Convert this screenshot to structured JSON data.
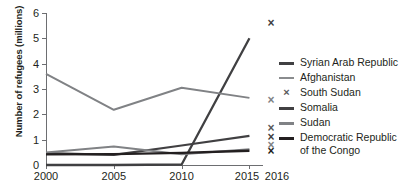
{
  "chart_data": {
    "type": "line",
    "title": "",
    "xlabel": "",
    "ylabel": "Number of refugees (millions)",
    "x": [
      2000,
      2005,
      2010,
      2015
    ],
    "xtick_labels": [
      "2000",
      "2005",
      "2010",
      "2015",
      "2016"
    ],
    "ytick_labels": [
      "0",
      "1",
      "2",
      "3",
      "4",
      "5",
      "6"
    ],
    "ylim": [
      0,
      6
    ],
    "xlim": [
      2000,
      2016
    ],
    "grid": false,
    "legend_position": "right",
    "marker_year": 2016,
    "marker_symbol": "×",
    "series": [
      {
        "name": "Syrian Arab Republic",
        "color": "#404042",
        "width": 2.3,
        "values": [
          0.0,
          0.0,
          0.02,
          5.0
        ],
        "marker_2016": 5.6
      },
      {
        "name": "Afghanistan",
        "color": "#808285",
        "width": 2.0,
        "values": [
          3.6,
          2.18,
          3.05,
          2.65
        ],
        "marker_2016": 2.55
      },
      {
        "name": "South Sudan",
        "color": "#58595b",
        "width": 0,
        "values": [
          null,
          null,
          null,
          null
        ],
        "marker_2016": 1.45
      },
      {
        "name": "Somalia",
        "color": "#414042",
        "width": 2.2,
        "values": [
          0.47,
          0.4,
          0.77,
          1.15
        ],
        "marker_2016": 1.1
      },
      {
        "name": "Sudan",
        "color": "#808285",
        "width": 2.0,
        "values": [
          0.49,
          0.73,
          0.42,
          0.62
        ],
        "marker_2016": 0.78
      },
      {
        "name": "Democratic Republic of the Congo",
        "color": "#231f20",
        "width": 2.4,
        "values": [
          0.42,
          0.43,
          0.48,
          0.56
        ],
        "marker_2016": 0.54
      }
    ]
  },
  "legend": {
    "items": [
      {
        "label": "Syrian Arab Republic",
        "marker": "line",
        "color": "#404042",
        "thickness": 2.6
      },
      {
        "label": "Afghanistan",
        "marker": "line",
        "color": "#8a8c8e",
        "thickness": 2.2
      },
      {
        "label": "South Sudan",
        "marker": "x",
        "color": "#58595b",
        "thickness": 0
      },
      {
        "label": "Somalia",
        "marker": "line",
        "color": "#414042",
        "thickness": 2.6
      },
      {
        "label": "Sudan",
        "marker": "line",
        "color": "#808285",
        "thickness": 2.2
      },
      {
        "label": "Democratic Republic\nof the Congo",
        "marker": "line",
        "color": "#231f20",
        "thickness": 2.8
      }
    ]
  },
  "axes": {
    "y_title": "Number of refugees (millions)",
    "y_ticks": [
      "6",
      "5",
      "4",
      "3",
      "2",
      "1",
      "0"
    ],
    "x_ticks": [
      "2000",
      "2005",
      "2010",
      "2015",
      "2016"
    ]
  },
  "colors": {
    "axis": "#6d6e71",
    "text": "#231f20",
    "background": "#ffffff"
  }
}
